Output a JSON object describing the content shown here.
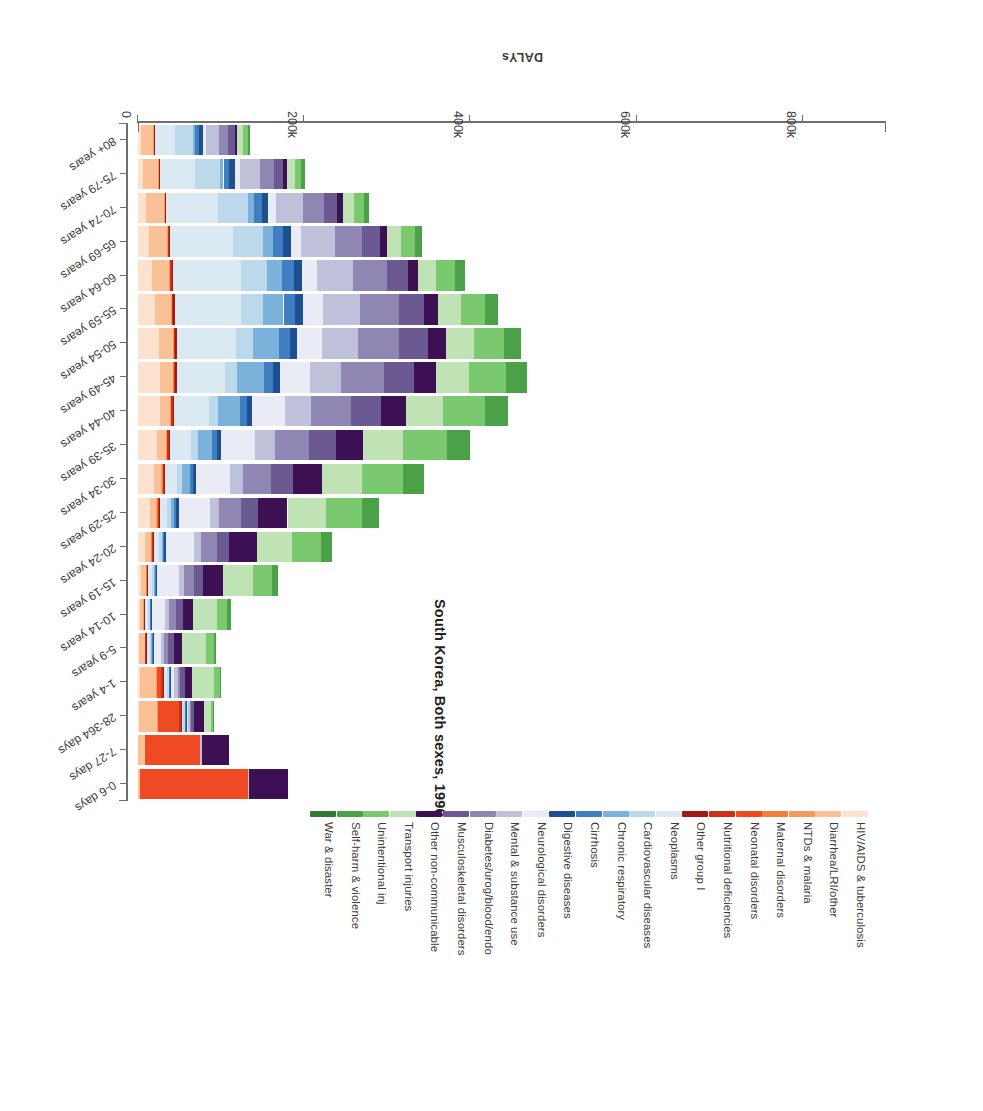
{
  "chart_data": {
    "type": "bar",
    "stacked": true,
    "orientation": "horizontal",
    "title": "South Korea, Both sexes, 1990",
    "xlabel": "DALYs",
    "ylabel": "",
    "grid": false,
    "legend_position": "top",
    "xlim": [
      0,
      900000
    ],
    "xticks": [
      0,
      200000,
      400000,
      600000,
      800000
    ],
    "xtick_labels": [
      "0",
      "200k",
      "400k",
      "600k",
      "800k"
    ],
    "categories": [
      "0-6 days",
      "7-27 days",
      "28-364 days",
      "1-4 years",
      "5-9 years",
      "10-14 years",
      "15-19 years",
      "20-24 years",
      "25-29 years",
      "30-34 years",
      "35-39 years",
      "40-44 years",
      "45-49 years",
      "50-54 years",
      "55-59 years",
      "60-64 years",
      "65-69 years",
      "70-74 years",
      "75-79 years",
      "80+ years"
    ],
    "series": [
      {
        "name": "HIV/AIDS & tuberculosis",
        "color": "#fde2cf",
        "values": [
          0,
          0,
          1000,
          2000,
          1500,
          2000,
          4000,
          9000,
          14000,
          19000,
          23000,
          26000,
          27000,
          25000,
          21000,
          17000,
          13000,
          9500,
          6000,
          4000
        ]
      },
      {
        "name": "Diarrhea/LRI/other",
        "color": "#fbc196",
        "values": [
          3000,
          9000,
          22000,
          20000,
          7000,
          5000,
          6000,
          7000,
          8000,
          9000,
          11000,
          13000,
          15000,
          17000,
          19000,
          21000,
          22000,
          22000,
          19000,
          15000
        ]
      },
      {
        "name": "NTDs & malaria",
        "color": "#f59a5c",
        "values": [
          0,
          0,
          500,
          500,
          300,
          300,
          400,
          500,
          600,
          700,
          800,
          900,
          1000,
          1000,
          900,
          800,
          700,
          500,
          400,
          300
        ]
      },
      {
        "name": "Maternal disorders",
        "color": "#f0803c",
        "values": [
          0,
          0,
          0,
          0,
          0,
          0,
          300,
          900,
          1400,
          1300,
          700,
          300,
          100,
          0,
          0,
          0,
          0,
          0,
          0,
          0
        ]
      },
      {
        "name": "Neonatal disorders",
        "color": "#ee4b22",
        "values": [
          129000,
          66000,
          26000,
          5000,
          0,
          0,
          0,
          0,
          0,
          0,
          0,
          0,
          0,
          0,
          0,
          0,
          0,
          0,
          0,
          0
        ]
      },
      {
        "name": "Nutritional deficiencies",
        "color": "#cf2e1b",
        "values": [
          0,
          0,
          2000,
          2500,
          1200,
          1000,
          1000,
          1000,
          1200,
          1400,
          1600,
          1800,
          1900,
          1900,
          1800,
          1600,
          1400,
          1200,
          900,
          700
        ]
      },
      {
        "name": "Other group I",
        "color": "#9e1a12",
        "values": [
          0,
          0,
          1500,
          1500,
          700,
          600,
          700,
          800,
          900,
          1000,
          1200,
          1400,
          1500,
          1500,
          1400,
          1200,
          1000,
          800,
          600,
          400
        ]
      },
      {
        "name": "Neoplasms",
        "color": "#dbe9f3",
        "values": [
          0,
          0,
          1500,
          3000,
          3500,
          3500,
          4500,
          6000,
          9000,
          15000,
          26000,
          42000,
          58000,
          72000,
          80000,
          82000,
          76000,
          62000,
          42000,
          24000
        ]
      },
      {
        "name": "Chronic respiratory",
        "color": "#bcd9ec",
        "values": [
          0,
          0,
          2500,
          3000,
          2500,
          2500,
          3000,
          3500,
          4500,
          6000,
          8000,
          11000,
          15000,
          20000,
          26000,
          32000,
          36000,
          36000,
          30000,
          22000
        ]
      },
      {
        "name": "Cirrhosis",
        "color": "#7bb2dc",
        "values": [
          0,
          0,
          300,
          400,
          300,
          300,
          500,
          1500,
          4000,
          9000,
          17000,
          26000,
          32000,
          31000,
          25000,
          18000,
          12000,
          7000,
          4000,
          2000
        ]
      },
      {
        "name": "Digestive diseases",
        "color": "#3f7fc1",
        "values": [
          0,
          0,
          800,
          900,
          700,
          700,
          900,
          1500,
          2500,
          4000,
          6000,
          8500,
          11000,
          13000,
          14000,
          14000,
          12500,
          10000,
          7000,
          4500
        ]
      },
      {
        "name": "Neurological disorders",
        "color": "#1d4f91",
        "values": [
          0,
          0,
          1200,
          1500,
          1200,
          1200,
          1500,
          2000,
          2800,
          3800,
          5000,
          6500,
          8000,
          9000,
          9500,
          9500,
          9000,
          8000,
          6500,
          5000
        ]
      },
      {
        "name": "Mental & substance use",
        "color": "#e9ecf5",
        "values": [
          0,
          0,
          800,
          3500,
          9000,
          16000,
          26000,
          34000,
          38000,
          40000,
          41000,
          40000,
          36000,
          30000,
          24000,
          18000,
          13000,
          9000,
          6000,
          4000
        ]
      },
      {
        "name": "Diabetes/urog/blood/endo",
        "color": "#bfc0da",
        "values": [
          2000,
          1500,
          3500,
          4500,
          4000,
          4500,
          6000,
          8000,
          11000,
          16000,
          23000,
          31000,
          38000,
          43000,
          45000,
          44000,
          40000,
          33000,
          24000,
          16000
        ]
      },
      {
        "name": "Musculoskeletal disorders",
        "color": "#8f86b4",
        "values": [
          0,
          0,
          700,
          2000,
          4500,
          8000,
          13000,
          19000,
          26000,
          34000,
          42000,
          48000,
          51000,
          50000,
          46000,
          40000,
          33000,
          25000,
          17000,
          11000
        ]
      },
      {
        "name": "Other non-communicable",
        "color": "#6b5a92",
        "values": [
          0,
          0,
          3000,
          6000,
          7000,
          8000,
          11000,
          15000,
          20000,
          26000,
          32000,
          36000,
          37000,
          35000,
          31000,
          26000,
          21000,
          16000,
          11000,
          7500
        ]
      },
      {
        "name": "Transport injuries",
        "color": "#3c1053",
        "values": [
          47000,
          33000,
          12000,
          9000,
          9000,
          12000,
          24000,
          34000,
          36000,
          35000,
          33000,
          30000,
          26000,
          21000,
          16000,
          12000,
          9000,
          6500,
          4500,
          3000
        ]
      },
      {
        "name": "Unintentional inj",
        "color": "#bfe3b5",
        "values": [
          0,
          0,
          9000,
          26000,
          30000,
          30000,
          36000,
          42000,
          46000,
          48000,
          48000,
          45000,
          40000,
          34000,
          28000,
          22000,
          17000,
          13000,
          9500,
          7000
        ]
      },
      {
        "name": "Self-harm & violence",
        "color": "#7bc96f",
        "values": [
          0,
          0,
          2000,
          7000,
          9000,
          12000,
          22000,
          34000,
          44000,
          50000,
          52000,
          50000,
          44000,
          36000,
          29000,
          22000,
          17000,
          12000,
          8000,
          5500
        ]
      },
      {
        "name": "War & disaster",
        "color": "#4aa148",
        "values": [
          0,
          0,
          500,
          1500,
          2500,
          4000,
          8000,
          14000,
          20000,
          25000,
          28000,
          28000,
          25000,
          21000,
          16000,
          12000,
          8500,
          6000,
          4000,
          2500
        ]
      }
    ]
  },
  "legend": {
    "items": [
      {
        "label": "HIV/AIDS & tuberculosis",
        "color": "#fde2cf"
      },
      {
        "label": "Diarrhea/LRI/other",
        "color": "#fbc196"
      },
      {
        "label": "NTDs & malaria",
        "color": "#f59a5c"
      },
      {
        "label": "Maternal disorders",
        "color": "#f0803c"
      },
      {
        "label": "Neonatal disorders",
        "color": "#ee4b22"
      },
      {
        "label": "Nutritional deficiencies",
        "color": "#cf2e1b"
      },
      {
        "label": "Other group I",
        "color": "#9e1a12"
      },
      {
        "label": "Neoplasms",
        "color": "#dbe9f3"
      },
      {
        "label": "Cardiovascular diseases",
        "color": "#bcd9ec"
      },
      {
        "label": "Chronic respiratory",
        "color": "#7bb2dc"
      },
      {
        "label": "Cirrhosis",
        "color": "#3f7fc1"
      },
      {
        "label": "Digestive diseases",
        "color": "#1d4f91"
      },
      {
        "label": "Neurological disorders",
        "color": "#e9ecf5"
      },
      {
        "label": "Mental & substance use",
        "color": "#bfc0da"
      },
      {
        "label": "Diabetes/urog/blood/endo",
        "color": "#8f86b4"
      },
      {
        "label": "Musculoskeletal disorders",
        "color": "#6b5a92"
      },
      {
        "label": "Other non-communicable",
        "color": "#3c1053"
      },
      {
        "label": "Transport injuries",
        "color": "#bfe3b5"
      },
      {
        "label": "Unintentional inj",
        "color": "#7bc96f"
      },
      {
        "label": "Self-harm & violence",
        "color": "#4aa148"
      },
      {
        "label": "War & disaster",
        "color": "#2f7a34"
      }
    ]
  },
  "axes": {
    "value_axis_title": "DALYs",
    "value_ticks": [
      "0",
      "200k",
      "400k",
      "600k",
      "800k"
    ],
    "category_ticks": [
      "0-6 days",
      "7-27 days",
      "28-364 days",
      "1-4 years",
      "5-9 years",
      "10-14 years",
      "15-19 years",
      "20-24 years",
      "25-29 years",
      "30-34 years",
      "35-39 years",
      "40-44 years",
      "45-49 years",
      "50-54 years",
      "55-59 years",
      "60-64 years",
      "65-69 years",
      "70-74 years",
      "75-79 years",
      "80+ years"
    ]
  }
}
